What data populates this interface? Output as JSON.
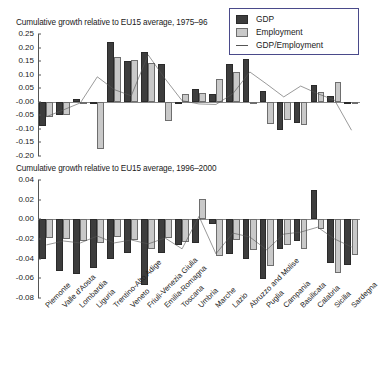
{
  "legend": {
    "items": [
      {
        "label": "GDP",
        "key": "swatch-dark",
        "color": "#3d3d3d"
      },
      {
        "label": "Employment",
        "key": "swatch-light",
        "color": "#c9c9c9"
      },
      {
        "label": "GDP/Employment",
        "key": "line",
        "color": "#555555"
      }
    ]
  },
  "chart_data": [
    {
      "type": "bar",
      "id": "top",
      "title": "Cumulative growth relative to EU15 average, 1975–96",
      "xlabel": "",
      "ylabel": "",
      "ylim": [
        -0.2,
        0.25
      ],
      "yticks": [
        0.25,
        0.2,
        0.15,
        0.1,
        0.05,
        -0.0,
        -0.05,
        -0.1,
        -0.15,
        -0.2
      ],
      "ytick_labels": [
        "0.25",
        "0.20",
        "0.15",
        "0.10",
        "0.05",
        "-0.00",
        "-0.05",
        "-0.10",
        "-0.15",
        "-0.20"
      ],
      "grid": false,
      "legend_position": "top-right",
      "categories": [
        "Piemonte",
        "Valle d'Aosta",
        "Lombardia",
        "Liguria",
        "Trentino-Alto Adige",
        "Veneto",
        "Friuli-Venezia Giulia",
        "Emilia-Romagna",
        "Toscana",
        "Umbria",
        "Marche",
        "Lazio",
        "Abruzzo and Molise",
        "Puglia",
        "Campania",
        "Basilicata",
        "Calabria",
        "Sicilia",
        "Sardegna"
      ],
      "series": [
        {
          "name": "GDP",
          "values": [
            -0.09,
            -0.048,
            0.012,
            0.0,
            0.222,
            0.152,
            0.182,
            0.14,
            0.0,
            0.046,
            0.03,
            0.138,
            0.157,
            0.04,
            -0.105,
            -0.08,
            0.063,
            0.02,
            0.0
          ]
        },
        {
          "name": "Employment",
          "values": [
            -0.057,
            -0.05,
            0.0,
            -0.174,
            0.166,
            0.155,
            0.143,
            -0.07,
            0.028,
            0.034,
            0.085,
            0.108,
            0.0,
            -0.083,
            -0.066,
            -0.085,
            0.036,
            0.073,
            0.0
          ]
        },
        {
          "name": "GDP/Employment",
          "type": "line",
          "values": [
            -0.055,
            -0.03,
            -0.004,
            0.092,
            0.045,
            0.022,
            0.173,
            0.085,
            0.004,
            -0.008,
            -0.01,
            0.03,
            0.11,
            0.065,
            0.018,
            0.058,
            0.03,
            0.006,
            -0.105
          ]
        }
      ]
    },
    {
      "type": "bar",
      "id": "bottom",
      "title": "Cumulative growth relative to EU15 average, 1996–2000",
      "xlabel": "",
      "ylabel": "",
      "ylim": [
        -0.08,
        0.04
      ],
      "yticks": [
        0.04,
        0.02,
        0.0,
        -0.02,
        -0.04,
        -0.06,
        -0.08
      ],
      "ytick_labels": [
        "0.04",
        "0.02",
        "0.00",
        "-0.02",
        "-0.04",
        "-0.06",
        "-0.08"
      ],
      "grid": false,
      "legend_position": "none",
      "categories": [
        "Piemonte",
        "Valle d'Aosta",
        "Lombardia",
        "Liguria",
        "Trentino-Alto Adige",
        "Veneto",
        "Friuli-Venezia Giulia",
        "Emilia-Romagna",
        "Toscana",
        "Umbria",
        "Marche",
        "Lazio",
        "Abruzzo and Molise",
        "Puglia",
        "Campania",
        "Basilicata",
        "Calabria",
        "Sicilia",
        "Sardegna"
      ],
      "series": [
        {
          "name": "GDP",
          "values": [
            -0.04,
            -0.053,
            -0.056,
            -0.05,
            -0.04,
            -0.034,
            -0.067,
            -0.034,
            -0.026,
            -0.024,
            -0.005,
            -0.035,
            -0.04,
            -0.061,
            -0.03,
            -0.022,
            0.03,
            -0.044,
            -0.046,
            -0.034
          ]
        },
        {
          "name": "Employment",
          "values": [
            -0.019,
            -0.02,
            -0.022,
            -0.024,
            -0.018,
            -0.021,
            -0.03,
            -0.019,
            -0.023,
            0.021,
            -0.037,
            -0.021,
            -0.031,
            -0.047,
            -0.026,
            -0.03,
            -0.01,
            -0.055,
            -0.036,
            -0.029
          ]
        },
        {
          "name": "GDP/Employment",
          "type": "line",
          "values": [
            -0.026,
            -0.022,
            -0.024,
            -0.017,
            -0.024,
            -0.021,
            -0.025,
            -0.019,
            -0.03,
            0.003,
            -0.035,
            -0.014,
            -0.018,
            -0.031,
            -0.015,
            -0.013,
            -0.008,
            -0.02,
            -0.028,
            -0.022
          ]
        }
      ]
    }
  ]
}
